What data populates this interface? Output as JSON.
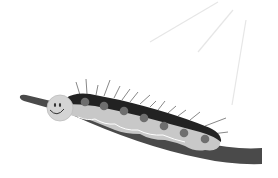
{
  "scene": {
    "subject": "caterpillar on branch",
    "caption_partial": "",
    "colors": {
      "background": "#ffffff",
      "branch": "#4a4a4a",
      "body_light": "#c8c8c8",
      "body_dark": "#222222",
      "spots": "#6e6e6e",
      "face": "#d4d4d4",
      "hair": "#777777",
      "rays": "#e4e4e4"
    }
  }
}
